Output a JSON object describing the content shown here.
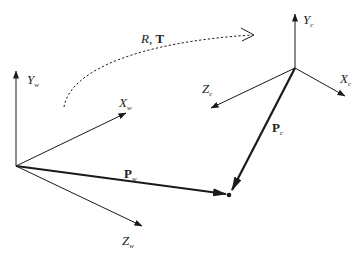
{
  "diagram": {
    "type": "coordinate-frame-transformation",
    "world_frame": {
      "axes": [
        {
          "name": "X",
          "subscript": "w"
        },
        {
          "name": "Y",
          "subscript": "w"
        },
        {
          "name": "Z",
          "subscript": "w"
        }
      ]
    },
    "camera_frame": {
      "axes": [
        {
          "name": "X",
          "subscript": "c"
        },
        {
          "name": "Y",
          "subscript": "c"
        },
        {
          "name": "Z",
          "subscript": "c"
        }
      ]
    },
    "vectors": [
      {
        "name": "P",
        "subscript": "w"
      },
      {
        "name": "P",
        "subscript": "c"
      }
    ],
    "transform": {
      "rotation": "R",
      "separator": ",",
      "translation": "T"
    },
    "colors": {
      "stroke": "#1a1a1a",
      "background": "#ffffff"
    }
  }
}
